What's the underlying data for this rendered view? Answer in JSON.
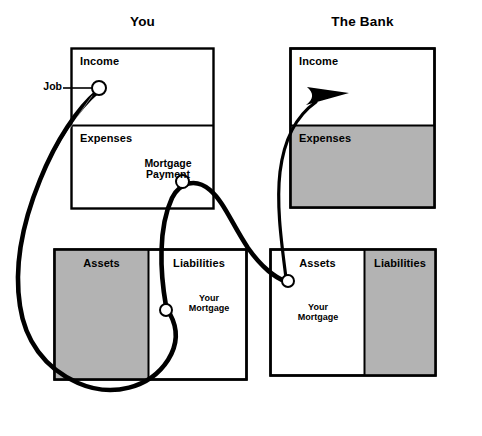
{
  "diagram": {
    "type": "cashflow-quadrant-diagram",
    "background_color": "#ffffff",
    "fill_color": "#b3b3b3",
    "stroke_color": "#000000",
    "panels": [
      {
        "id": "you",
        "title": "You",
        "income_statement": {
          "income_label": "Income",
          "expenses_label": "Expenses",
          "income_shaded": false,
          "expenses_shaded": false
        },
        "balance_sheet": {
          "assets_label": "Assets",
          "liabilities_label": "Liabilities",
          "assets_shaded": true,
          "liabilities_shaded": false,
          "liabilities_entry": "Your\nMortgage",
          "liabilities_entry_line1": "Your",
          "liabilities_entry_line2": "Mortgage"
        }
      },
      {
        "id": "the-bank",
        "title": "The Bank",
        "income_statement": {
          "income_label": "Income",
          "expenses_label": "Expenses",
          "income_shaded": false,
          "expenses_shaded": true
        },
        "balance_sheet": {
          "assets_label": "Assets",
          "liabilities_label": "Liabilities",
          "assets_shaded": false,
          "liabilities_shaded": true,
          "assets_entry_line1": "Your",
          "assets_entry_line2": "Mortgage"
        }
      }
    ],
    "flows": [
      {
        "id": "job-flow",
        "label": "Job",
        "from": "external",
        "to": "you-income",
        "has_leader_line": true
      },
      {
        "id": "mortgage-payment-flow",
        "label_line1": "Mortgage",
        "label_line2": "Payment",
        "from": "you-expenses",
        "to": "bank-income",
        "has_arrow": true
      },
      {
        "id": "your-mortgage-flow",
        "label_line1": "Your",
        "label_line2": "Mortgage",
        "from": "bank-assets",
        "to": "you-liabilities"
      }
    ],
    "nodes": [
      {
        "id": "job-node",
        "x": 99,
        "y": 88
      },
      {
        "id": "mortgage-payment-node",
        "x": 183,
        "y": 182
      },
      {
        "id": "your-mortgage-node-left",
        "x": 166,
        "y": 310
      },
      {
        "id": "bank-assets-node",
        "x": 288,
        "y": 281
      }
    ]
  }
}
